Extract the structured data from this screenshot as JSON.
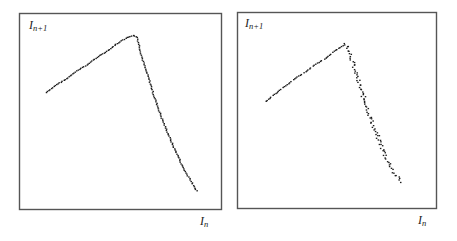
{
  "figure": {
    "panels": [
      {
        "id": "left",
        "ylabel_main": "I",
        "ylabel_sub": "n+1",
        "xlabel_main": "I",
        "xlabel_sub": "n"
      },
      {
        "id": "right",
        "ylabel_main": "I",
        "ylabel_sub": "n+1",
        "xlabel_main": "I",
        "xlabel_sub": "n"
      }
    ]
  },
  "chart_data": [
    {
      "type": "scatter",
      "title": "",
      "xlabel": "I_n",
      "ylabel": "I_n+1",
      "grid": false,
      "legend": "none",
      "axis_ticks": "none",
      "description": "Return map: tent-like curve; nearly linear rising branch then steeper, slightly curved falling branch, tightly clustered points",
      "x": [
        0.13,
        0.18,
        0.23,
        0.28,
        0.33,
        0.38,
        0.43,
        0.48,
        0.53,
        0.56,
        0.58,
        0.6,
        0.62,
        0.64,
        0.66,
        0.68,
        0.7,
        0.72,
        0.74,
        0.76,
        0.78,
        0.8,
        0.82,
        0.84,
        0.86,
        0.88
      ],
      "y": [
        0.6,
        0.64,
        0.67,
        0.71,
        0.74,
        0.78,
        0.81,
        0.85,
        0.88,
        0.89,
        0.88,
        0.79,
        0.72,
        0.66,
        0.59,
        0.53,
        0.47,
        0.42,
        0.37,
        0.32,
        0.28,
        0.23,
        0.19,
        0.16,
        0.12,
        0.09
      ],
      "peak": {
        "x": 0.56,
        "y": 0.89
      },
      "xlim": [
        0,
        1
      ],
      "ylim": [
        0,
        1
      ]
    },
    {
      "type": "scatter",
      "title": "",
      "xlabel": "I_n",
      "ylabel": "I_n+1",
      "grid": false,
      "legend": "none",
      "axis_ticks": "none",
      "description": "Return map: tent-like curve; rising dashed branch, falling branch broader/more scattered near middle",
      "x": [
        0.14,
        0.19,
        0.24,
        0.29,
        0.34,
        0.39,
        0.44,
        0.49,
        0.52,
        0.54,
        0.56,
        0.58,
        0.6,
        0.62,
        0.64,
        0.66,
        0.68,
        0.7,
        0.72,
        0.74,
        0.76,
        0.78,
        0.8,
        0.82
      ],
      "y": [
        0.55,
        0.59,
        0.63,
        0.67,
        0.7,
        0.74,
        0.77,
        0.81,
        0.83,
        0.84,
        0.81,
        0.73,
        0.66,
        0.6,
        0.54,
        0.48,
        0.42,
        0.37,
        0.32,
        0.27,
        0.23,
        0.19,
        0.16,
        0.13
      ],
      "peak": {
        "x": 0.54,
        "y": 0.84
      },
      "xlim": [
        0,
        1
      ],
      "ylim": [
        0,
        1
      ]
    }
  ]
}
